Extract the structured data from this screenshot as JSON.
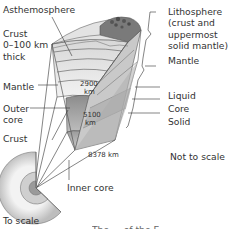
{
  "diagram": {
    "labels": {
      "asthenosphere": "Asthemosphere",
      "crust_line1": "Crust",
      "crust_line2": "0–100 km",
      "crust_line3": "thick",
      "mantle_left": "Mantle",
      "outer_core_line1": "Outer",
      "outer_core_line2": "core",
      "crust_lower": "Crust",
      "inner_core": "Inner core",
      "to_scale": "To scale",
      "lithosphere_line1": "Lithosphere",
      "lithosphere_line2": "(crust and",
      "lithosphere_line3": "uppermost",
      "lithosphere_line4": "solid mantle)",
      "mantle_right": "Mantle",
      "liquid": "Liquid",
      "core": "Core",
      "solid": "Solid",
      "not_to_scale": "Not to scale"
    },
    "depths": {
      "d2900": "2900",
      "d2900_unit": "km",
      "d5100": "5100",
      "d5100_unit": "km",
      "d8378": "8378 km"
    },
    "caption_fragment": "The ... of the E"
  }
}
